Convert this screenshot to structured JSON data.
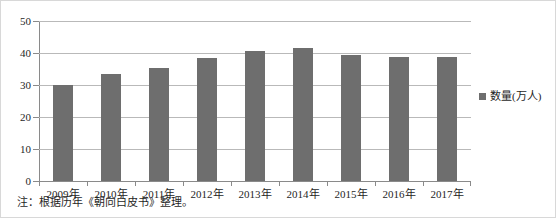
{
  "chart_data": {
    "type": "bar",
    "title": "",
    "xlabel": "",
    "ylabel": "",
    "categories": [
      "2009年",
      "2010年",
      "2011年",
      "2012年",
      "2013年",
      "2014年",
      "2015年",
      "2016年",
      "2017年"
    ],
    "values": [
      30.0,
      33.5,
      35.2,
      38.3,
      40.5,
      41.5,
      39.5,
      38.8,
      38.8
    ],
    "series": [
      {
        "name": "数量(万人)",
        "values": [
          30.0,
          33.5,
          35.2,
          38.3,
          40.5,
          41.5,
          39.5,
          38.8,
          38.8
        ],
        "color": "#6e6e6e"
      }
    ],
    "ylim": [
      0,
      50
    ],
    "yticks": [
      0,
      10,
      20,
      30,
      40,
      50
    ],
    "ytick_labels": [
      "0",
      "10",
      "20",
      "30",
      "40",
      "50"
    ],
    "grid": true,
    "grid_axis": "y",
    "legend_position": "right"
  },
  "legend": {
    "label": "数量(万人)",
    "swatch_color": "#6e6e6e"
  },
  "note": {
    "text": "注：根据历年《朝向白皮书》整理。"
  },
  "colors": {
    "bar": "#6e6e6e",
    "gridline": "#b9b9b9",
    "axis": "#8a8a8a",
    "frame": "#d8d8d8",
    "text": "#1f1f1f",
    "background": "#ffffff"
  }
}
